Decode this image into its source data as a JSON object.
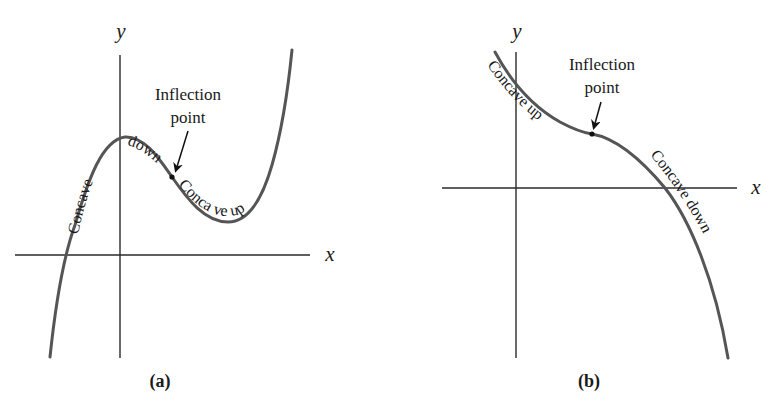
{
  "colors": {
    "background": "#ffffff",
    "axis": "#2a2a2a",
    "curve": "#555555",
    "text": "#1a1a1a"
  },
  "panels": [
    {
      "id": "a",
      "caption": "(a)",
      "x_axis_label": "x",
      "y_axis_label": "y",
      "annotation_line1": "Inflection",
      "annotation_line2": "point",
      "curve_labels": [
        "Concave",
        "down",
        "Conca ve up"
      ],
      "curve_shape": "cubic: rises from bottom-left, local max near y-axis, inflection, local min, rises steeply to top-right"
    },
    {
      "id": "b",
      "caption": "(b)",
      "x_axis_label": "x",
      "y_axis_label": "y",
      "annotation_line1": "Inflection",
      "annotation_line2": "point",
      "curve_labels": [
        "Concave up",
        "Concave down"
      ],
      "curve_shape": "decreasing cubic: concave up from top-left, inflection, concave down falling to bottom-right"
    }
  ]
}
